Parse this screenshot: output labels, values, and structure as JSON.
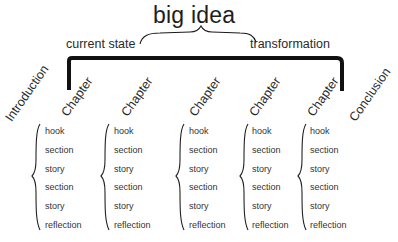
{
  "diagram": {
    "title": "big idea",
    "left_label": "current state",
    "right_label": "transformation",
    "intro_label": "Introduction",
    "conclusion_label": "Conclusion",
    "chapters": [
      {
        "label": "Chapter",
        "items": [
          "hook",
          "section",
          "story",
          "section",
          "story",
          "reflection"
        ]
      },
      {
        "label": "Chapter",
        "items": [
          "hook",
          "section",
          "story",
          "section",
          "story",
          "reflection"
        ]
      },
      {
        "label": "Chapter",
        "items": [
          "hook",
          "section",
          "story",
          "section",
          "story",
          "reflection"
        ]
      },
      {
        "label": "Chapter",
        "items": [
          "hook",
          "section",
          "story",
          "section",
          "story",
          "reflection"
        ]
      },
      {
        "label": "Chapter",
        "items": [
          "hook",
          "section",
          "story",
          "section",
          "story",
          "reflection"
        ]
      }
    ],
    "colors": {
      "ink": "#1a1a1a",
      "text": "#2a2a2a",
      "background": "#ffffff"
    }
  }
}
